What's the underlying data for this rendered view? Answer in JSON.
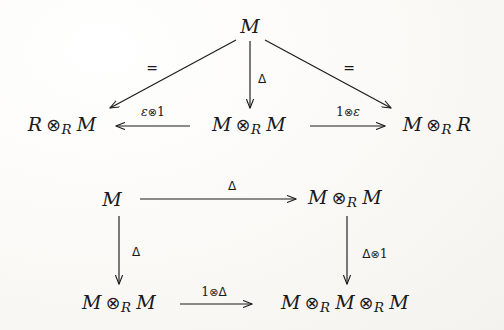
{
  "figure": {
    "kind": "commutative-diagrams",
    "ink_color": "#1a1a1a",
    "background_color": "#faf9f6"
  },
  "diagrams": [
    {
      "id": "counit-diagram",
      "name": "counit triangle diagram",
      "nodes": [
        {
          "id": "apex",
          "label": "M",
          "x": 250,
          "y": 26
        },
        {
          "id": "bottom-left",
          "label": "R ⊗_R M",
          "x": 62,
          "y": 126
        },
        {
          "id": "bottom-mid",
          "label": "M ⊗_R M",
          "x": 249,
          "y": 126
        },
        {
          "id": "bottom-right",
          "label": "M ⊗_R R",
          "x": 437,
          "y": 126
        }
      ],
      "arrows": [
        {
          "id": "apex-to-left",
          "label": "=",
          "from": "apex",
          "to": "bottom-left",
          "label_x": 152,
          "label_y": 68
        },
        {
          "id": "apex-to-mid",
          "label": "Δ",
          "from": "apex",
          "to": "bottom-mid",
          "label_x": 262,
          "label_y": 79
        },
        {
          "id": "apex-to-right",
          "label": "=",
          "from": "apex",
          "to": "bottom-right",
          "label_x": 349,
          "label_y": 68
        },
        {
          "id": "mid-to-left",
          "label": "ε⊗1",
          "from": "bottom-mid",
          "to": "bottom-left",
          "label_x": 153,
          "label_y": 112
        },
        {
          "id": "mid-to-right",
          "label": "1⊗ε",
          "from": "bottom-mid",
          "to": "bottom-right",
          "label_x": 348,
          "label_y": 112
        }
      ]
    },
    {
      "id": "coassociativity-diagram",
      "name": "coassociativity square diagram",
      "nodes": [
        {
          "id": "top-left",
          "label": "M",
          "x": 112,
          "y": 199
        },
        {
          "id": "top-right",
          "label": "M ⊗_R M",
          "x": 345,
          "y": 199
        },
        {
          "id": "bottom-left",
          "label": "M ⊗_R M",
          "x": 119,
          "y": 304
        },
        {
          "id": "bottom-right",
          "label": "M ⊗_R M ⊗_R M",
          "x": 345,
          "y": 304
        }
      ],
      "arrows": [
        {
          "id": "top-edge",
          "label": "Δ",
          "from": "top-left",
          "to": "top-right",
          "label_x": 232,
          "label_y": 186
        },
        {
          "id": "left-edge",
          "label": "Δ",
          "from": "top-left",
          "to": "bottom-left",
          "label_x": 136,
          "label_y": 252
        },
        {
          "id": "right-edge",
          "label": "Δ⊗1",
          "from": "top-right",
          "to": "bottom-right",
          "label_x": 375,
          "label_y": 254
        },
        {
          "id": "bottom-edge",
          "label": "1⊗Δ",
          "from": "bottom-left",
          "to": "bottom-right",
          "label_x": 214,
          "label_y": 292
        }
      ]
    }
  ],
  "symbols": {
    "tensor": "⊗",
    "subscript_ring": "R",
    "comultiplication": "Δ",
    "counit": "ε",
    "identity": "1",
    "equals": "=",
    "module": "M",
    "ring": "R"
  }
}
